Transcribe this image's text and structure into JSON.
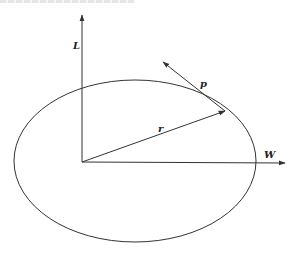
{
  "diagram": {
    "labels": {
      "vertical_axis": "L",
      "horizontal_axis": "W",
      "radius_vector": "r",
      "momentum_vector": "p"
    },
    "colors": {
      "stroke": "#333333",
      "background": "#ffffff"
    },
    "geometry": {
      "origin": [
        82,
        162
      ],
      "ellipse_center": [
        135,
        161
      ],
      "ellipse_rx": 121,
      "ellipse_ry": 81,
      "L_axis_tip": [
        82,
        15
      ],
      "W_axis_tip": [
        285,
        163
      ],
      "r_tip": [
        225,
        111
      ],
      "p_tip": [
        163,
        62
      ]
    }
  }
}
